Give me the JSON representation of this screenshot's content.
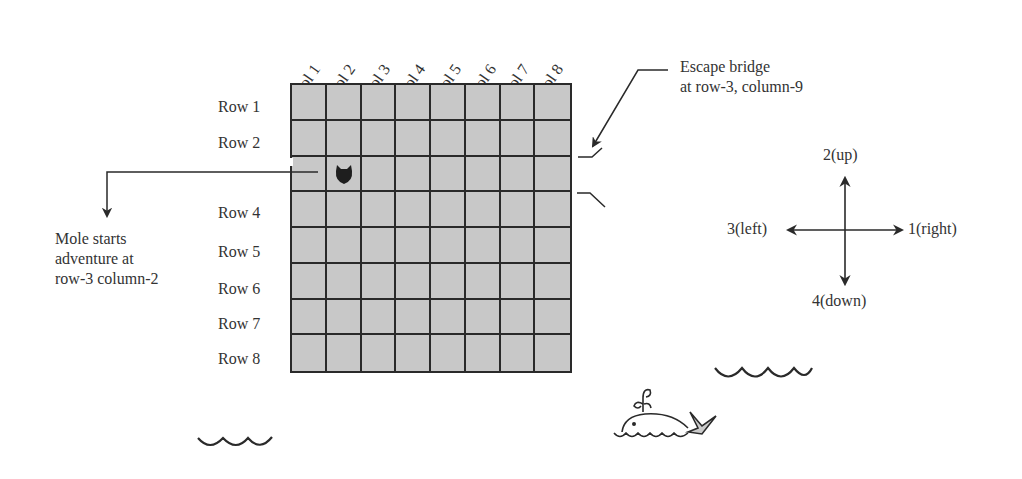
{
  "diagram": {
    "grid": {
      "rows": 8,
      "cols": 8,
      "cell_color": "#c8c8c8",
      "line_color": "#2a2a2a",
      "column_labels": [
        "Col 1",
        "Col 2",
        "Col 3",
        "Col 4",
        "Col 5",
        "Col 6",
        "Col 7",
        "Col 8"
      ],
      "row_labels": [
        "Row 1",
        "Row 2",
        "Row 4",
        "Row 5",
        "Row 6",
        "Row 7",
        "Row 8"
      ],
      "mole_position": {
        "row": 3,
        "col": 2
      }
    },
    "annotations": {
      "escape_bridge": {
        "line1": "Escape bridge",
        "line2": "at row-3, column-9"
      },
      "mole_start": {
        "line1": "Mole starts",
        "line2": "adventure at",
        "line3": "row-3 column-2"
      }
    },
    "directions": {
      "up": "2(up)",
      "left": "3(left)",
      "right": "1(right)",
      "down": "4(down)"
    },
    "decorations": [
      "whale-icon",
      "wave-icon",
      "wave-icon"
    ]
  }
}
